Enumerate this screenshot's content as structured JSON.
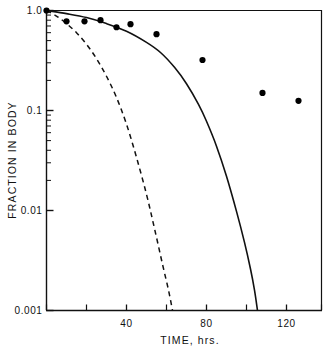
{
  "chart_data": {
    "type": "scatter",
    "title": "",
    "xlabel": "TIME, hrs.",
    "ylabel": "FRACTION IN BODY",
    "yscale": "log",
    "xlim": [
      0,
      137.5
    ],
    "ylim": [
      0.001,
      1.0
    ],
    "grid": false,
    "legend": "none",
    "x_ticks_major": [
      40,
      80,
      120
    ],
    "x_ticks_major_labels": [
      "40",
      "80",
      "120"
    ],
    "x_ticks_minor": [
      0,
      20,
      60,
      100,
      137.5
    ],
    "y_ticks_major": [
      1.0,
      0.1,
      0.01,
      0.001
    ],
    "y_ticks_major_labels": [
      "1.0",
      "0.1",
      "0.01",
      "0.001"
    ],
    "series": [
      {
        "name": "observed data",
        "type": "scatter",
        "marker": "filled-circle",
        "color": "#000000",
        "points": [
          {
            "x": 0,
            "y": 1.0
          },
          {
            "x": 10,
            "y": 0.78
          },
          {
            "x": 19,
            "y": 0.78
          },
          {
            "x": 27,
            "y": 0.8
          },
          {
            "x": 35,
            "y": 0.68
          },
          {
            "x": 42,
            "y": 0.73
          },
          {
            "x": 55,
            "y": 0.58
          },
          {
            "x": 78,
            "y": 0.32
          },
          {
            "x": 108,
            "y": 0.15
          },
          {
            "x": 126,
            "y": 0.125
          }
        ]
      },
      {
        "name": "solid model curve",
        "type": "line",
        "style": "solid",
        "color": "#000000",
        "points": [
          {
            "x": 0,
            "y": 1.0
          },
          {
            "x": 10,
            "y": 0.93
          },
          {
            "x": 20,
            "y": 0.85
          },
          {
            "x": 30,
            "y": 0.74
          },
          {
            "x": 40,
            "y": 0.62
          },
          {
            "x": 50,
            "y": 0.48
          },
          {
            "x": 57,
            "y": 0.38
          },
          {
            "x": 64,
            "y": 0.27
          },
          {
            "x": 70,
            "y": 0.185
          },
          {
            "x": 76,
            "y": 0.115
          },
          {
            "x": 80,
            "y": 0.078
          },
          {
            "x": 85,
            "y": 0.044
          },
          {
            "x": 90,
            "y": 0.022
          },
          {
            "x": 95,
            "y": 0.0098
          },
          {
            "x": 99,
            "y": 0.0048
          },
          {
            "x": 102,
            "y": 0.0026
          },
          {
            "x": 104,
            "y": 0.0016
          },
          {
            "x": 105.5,
            "y": 0.001
          }
        ]
      },
      {
        "name": "dashed model curve",
        "type": "line",
        "style": "dashed",
        "color": "#000000",
        "points": [
          {
            "x": 0,
            "y": 1.0
          },
          {
            "x": 5,
            "y": 0.88
          },
          {
            "x": 10,
            "y": 0.74
          },
          {
            "x": 15,
            "y": 0.6
          },
          {
            "x": 20,
            "y": 0.46
          },
          {
            "x": 25,
            "y": 0.33
          },
          {
            "x": 30,
            "y": 0.22
          },
          {
            "x": 35,
            "y": 0.135
          },
          {
            "x": 40,
            "y": 0.073
          },
          {
            "x": 45,
            "y": 0.034
          },
          {
            "x": 50,
            "y": 0.0145
          },
          {
            "x": 54,
            "y": 0.0066
          },
          {
            "x": 58,
            "y": 0.0029
          },
          {
            "x": 61,
            "y": 0.0016
          },
          {
            "x": 63,
            "y": 0.001
          }
        ]
      }
    ]
  },
  "axes": {
    "x_title": "TIME, hrs.",
    "y_title": "FRACTION IN BODY",
    "y_labels": [
      "1.0",
      "0.1",
      "0.01",
      "0.001"
    ],
    "x_labels": [
      "40",
      "80",
      "120"
    ]
  }
}
